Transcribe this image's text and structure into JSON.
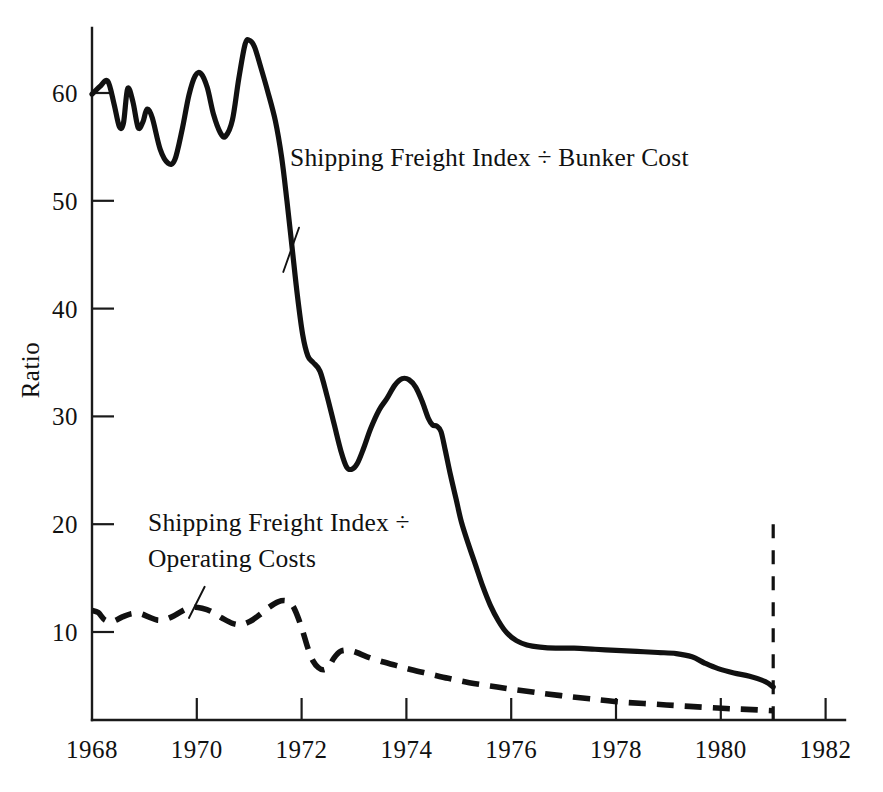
{
  "chart_data": {
    "type": "line",
    "title": "",
    "subtitle": "",
    "xlabel": "",
    "ylabel": "Ratio",
    "xlim": [
      1968,
      1982.6
    ],
    "ylim": [
      0,
      66
    ],
    "grid": false,
    "legend_position": "inline-annotations",
    "x_ticks": [
      "1968",
      "1970",
      "1972",
      "1974",
      "1976",
      "1978",
      "1980",
      "1982"
    ],
    "x_tick_values": [
      1968,
      1970,
      1972,
      1974,
      1976,
      1978,
      1980,
      1982
    ],
    "y_ticks": [
      "10",
      "20",
      "30",
      "40",
      "50",
      "60"
    ],
    "y_tick_values": [
      10,
      20,
      30,
      40,
      50,
      60
    ],
    "annotations": [
      {
        "name": "bunker-cost-annotation",
        "text": "Shipping Freight Index ÷ Bunker Cost",
        "leader_from": [
          1971.95,
          47.5
        ],
        "leader_to": [
          1971.65,
          43.4
        ]
      },
      {
        "name": "operating-costs-annotation",
        "text": "Shipping Freight Index ÷\nOperating Costs",
        "leader_from": [
          1970.15,
          14.2
        ],
        "leader_to": [
          1969.85,
          11.3
        ]
      }
    ],
    "marker_lines": [
      {
        "name": "year-1981-marker",
        "x": 1981.0,
        "y_from": 0,
        "y_to": 20.0,
        "style": "dashed"
      }
    ],
    "series": [
      {
        "name": "Shipping Freight Index ÷ Bunker Cost",
        "style": "solid",
        "color": "#111111",
        "points": [
          [
            1968.0,
            59.9
          ],
          [
            1968.15,
            60.6
          ],
          [
            1968.3,
            61.1
          ],
          [
            1968.42,
            59.0
          ],
          [
            1968.52,
            56.9
          ],
          [
            1968.6,
            57.2
          ],
          [
            1968.68,
            60.4
          ],
          [
            1968.78,
            59.2
          ],
          [
            1968.88,
            56.8
          ],
          [
            1968.97,
            57.3
          ],
          [
            1969.05,
            58.5
          ],
          [
            1969.15,
            57.7
          ],
          [
            1969.3,
            54.8
          ],
          [
            1969.45,
            53.5
          ],
          [
            1969.58,
            53.8
          ],
          [
            1969.72,
            56.6
          ],
          [
            1969.85,
            59.8
          ],
          [
            1969.97,
            61.6
          ],
          [
            1970.08,
            61.8
          ],
          [
            1970.2,
            60.5
          ],
          [
            1970.32,
            58.0
          ],
          [
            1970.45,
            56.3
          ],
          [
            1970.55,
            56.0
          ],
          [
            1970.68,
            57.5
          ],
          [
            1970.8,
            61.3
          ],
          [
            1970.92,
            64.5
          ],
          [
            1971.0,
            64.9
          ],
          [
            1971.1,
            64.3
          ],
          [
            1971.22,
            62.4
          ],
          [
            1971.35,
            60.2
          ],
          [
            1971.5,
            57.4
          ],
          [
            1971.62,
            54.0
          ],
          [
            1971.72,
            50.0
          ],
          [
            1971.82,
            45.6
          ],
          [
            1971.92,
            41.2
          ],
          [
            1972.02,
            37.6
          ],
          [
            1972.12,
            35.6
          ],
          [
            1972.22,
            35.0
          ],
          [
            1972.35,
            34.2
          ],
          [
            1972.48,
            32.0
          ],
          [
            1972.62,
            29.3
          ],
          [
            1972.75,
            26.8
          ],
          [
            1972.86,
            25.3
          ],
          [
            1972.96,
            25.1
          ],
          [
            1973.06,
            25.6
          ],
          [
            1973.18,
            27.0
          ],
          [
            1973.32,
            28.9
          ],
          [
            1973.48,
            30.6
          ],
          [
            1973.62,
            31.6
          ],
          [
            1973.78,
            32.9
          ],
          [
            1973.92,
            33.5
          ],
          [
            1974.05,
            33.4
          ],
          [
            1974.18,
            32.7
          ],
          [
            1974.3,
            31.4
          ],
          [
            1974.42,
            29.8
          ],
          [
            1974.5,
            29.2
          ],
          [
            1974.58,
            29.1
          ],
          [
            1974.66,
            28.6
          ],
          [
            1974.74,
            26.9
          ],
          [
            1974.84,
            24.6
          ],
          [
            1974.95,
            22.3
          ],
          [
            1975.05,
            20.2
          ],
          [
            1975.18,
            18.2
          ],
          [
            1975.32,
            16.2
          ],
          [
            1975.46,
            14.2
          ],
          [
            1975.6,
            12.5
          ],
          [
            1975.76,
            11.0
          ],
          [
            1975.92,
            9.9
          ],
          [
            1976.1,
            9.2
          ],
          [
            1976.3,
            8.8
          ],
          [
            1976.55,
            8.6
          ],
          [
            1976.85,
            8.5
          ],
          [
            1977.2,
            8.5
          ],
          [
            1977.6,
            8.4
          ],
          [
            1978.0,
            8.3
          ],
          [
            1978.4,
            8.2
          ],
          [
            1978.8,
            8.1
          ],
          [
            1979.15,
            8.0
          ],
          [
            1979.45,
            7.7
          ],
          [
            1979.7,
            7.1
          ],
          [
            1979.95,
            6.6
          ],
          [
            1980.25,
            6.2
          ],
          [
            1980.55,
            5.9
          ],
          [
            1980.85,
            5.4
          ],
          [
            1981.0,
            4.9
          ]
        ]
      },
      {
        "name": "Shipping Freight Index ÷ Operating Costs",
        "style": "dashed",
        "color": "#111111",
        "points": [
          [
            1968.0,
            12.0
          ],
          [
            1968.12,
            11.8
          ],
          [
            1968.25,
            11.1
          ],
          [
            1968.4,
            11.0
          ],
          [
            1968.58,
            11.4
          ],
          [
            1968.75,
            11.7
          ],
          [
            1968.92,
            11.7
          ],
          [
            1969.08,
            11.4
          ],
          [
            1969.25,
            11.1
          ],
          [
            1969.42,
            11.2
          ],
          [
            1969.6,
            11.6
          ],
          [
            1969.78,
            12.1
          ],
          [
            1969.95,
            12.3
          ],
          [
            1970.1,
            12.2
          ],
          [
            1970.28,
            11.9
          ],
          [
            1970.48,
            11.3
          ],
          [
            1970.68,
            10.8
          ],
          [
            1970.85,
            10.7
          ],
          [
            1971.02,
            11.0
          ],
          [
            1971.2,
            11.6
          ],
          [
            1971.38,
            12.3
          ],
          [
            1971.55,
            12.8
          ],
          [
            1971.7,
            12.9
          ],
          [
            1971.82,
            12.5
          ],
          [
            1971.92,
            11.5
          ],
          [
            1972.02,
            10.1
          ],
          [
            1972.12,
            8.5
          ],
          [
            1972.22,
            7.3
          ],
          [
            1972.32,
            6.7
          ],
          [
            1972.42,
            6.5
          ],
          [
            1972.52,
            6.8
          ],
          [
            1972.62,
            7.6
          ],
          [
            1972.74,
            8.2
          ],
          [
            1972.88,
            8.3
          ],
          [
            1973.05,
            8.1
          ],
          [
            1973.25,
            7.7
          ],
          [
            1973.5,
            7.3
          ],
          [
            1973.8,
            6.9
          ],
          [
            1974.1,
            6.5
          ],
          [
            1974.45,
            6.1
          ],
          [
            1974.8,
            5.7
          ],
          [
            1975.2,
            5.3
          ],
          [
            1975.6,
            5.0
          ],
          [
            1976.0,
            4.7
          ],
          [
            1976.45,
            4.4
          ],
          [
            1976.95,
            4.1
          ],
          [
            1977.5,
            3.8
          ],
          [
            1978.1,
            3.5
          ],
          [
            1978.75,
            3.3
          ],
          [
            1979.4,
            3.1
          ],
          [
            1980.1,
            2.9
          ],
          [
            1980.6,
            2.8
          ],
          [
            1981.0,
            2.7
          ]
        ]
      }
    ]
  },
  "geometry": {
    "plot_left_px": 92,
    "plot_right_px": 845,
    "axis_bottom_px": 720,
    "axis_top_px": 28,
    "px_per_year": 52.4,
    "y_value_60_px": 93,
    "y_value_10_px": 632
  }
}
